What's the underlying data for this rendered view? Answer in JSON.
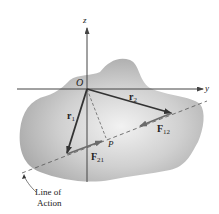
{
  "diagram": {
    "axes": {
      "z_label": "z",
      "y_label": "y",
      "origin_label": "O"
    },
    "vectors": [
      {
        "id": "r1",
        "label": "r",
        "sub": "1"
      },
      {
        "id": "r2",
        "label": "r",
        "sub": "2"
      },
      {
        "id": "F12",
        "label": "F",
        "sub": "12"
      },
      {
        "id": "F21",
        "label": "F",
        "sub": "21"
      }
    ],
    "point_label": "P",
    "line_of_action_label_line1": "Line of",
    "line_of_action_label_line2": "Action",
    "colors": {
      "body_fill": "#bdbdbd",
      "vector": "#333333",
      "force": "#6b6b6b",
      "axis": "#555555"
    }
  }
}
